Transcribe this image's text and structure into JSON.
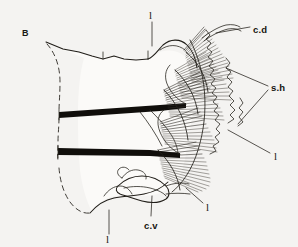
{
  "figure": {
    "panel_label": "B",
    "background_color": "#f4f3f1",
    "ink_color": "#201d18",
    "type": "scientific-line-drawing",
    "labels": [
      {
        "id": "c-d",
        "text": "c.d",
        "x": 253,
        "y": 30,
        "leader_from": [
          250,
          27
        ],
        "leader_to": [
          216,
          33
        ]
      },
      {
        "id": "s-h",
        "text": "s.h",
        "x": 271,
        "y": 88,
        "leader_from": [
          268,
          85
        ],
        "leader_to": [
          226,
          68
        ]
      },
      {
        "id": "c-v",
        "text": "c.v",
        "x": 146,
        "y": 226,
        "leader_from": [
          151,
          216
        ],
        "leader_to": [
          152,
          196
        ]
      },
      {
        "id": "l-top",
        "text": "l",
        "x": 150,
        "y": 16,
        "leader_from": [
          152,
          22
        ],
        "leader_to": [
          152,
          46
        ]
      },
      {
        "id": "l-right-1",
        "text": "l",
        "x": 275,
        "y": 157,
        "leader_from": [
          272,
          153
        ],
        "leader_to": [
          232,
          132
        ]
      },
      {
        "id": "l-right-2",
        "text": "l",
        "x": 207,
        "y": 208,
        "leader_from": [
          205,
          203
        ],
        "leader_to": [
          196,
          190
        ]
      },
      {
        "id": "l-bottom",
        "text": "l",
        "x": 107,
        "y": 240,
        "leader_from": [
          109,
          234
        ],
        "leader_to": [
          109,
          212
        ]
      }
    ],
    "features": {
      "dark_band_upper": "thick transverse dark band (upper segment boundary)",
      "dark_band_lower": "thick transverse dark band (lower segment boundary)",
      "dashed_margin": "dashed left body margin",
      "chaetal_fan": "dense radiating fan of setae on right margin"
    },
    "counts": {
      "dark_bands": 2,
      "leader_lines": 7,
      "text_labels": 7
    }
  }
}
